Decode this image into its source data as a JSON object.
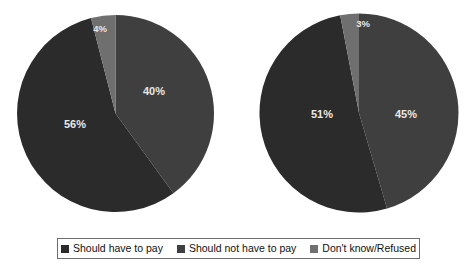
{
  "chart_data": [
    {
      "type": "pie",
      "title": "",
      "chart_index": 1,
      "categories": [
        "Should have to pay",
        "Should not have to pay",
        "Don't know/Refused"
      ],
      "values": [
        56,
        40,
        4
      ],
      "labels": [
        "56%",
        "40%",
        "4%"
      ],
      "colors": [
        "#2b2b2b",
        "#3f3f3f",
        "#6f6f6f"
      ],
      "legend_position": "bottom",
      "grid": false
    },
    {
      "type": "pie",
      "title": "",
      "chart_index": 2,
      "categories": [
        "Should have to pay",
        "Should not have to pay",
        "Don't know/Refused"
      ],
      "values": [
        51,
        45,
        3
      ],
      "labels": [
        "51%",
        "45%",
        "3%"
      ],
      "colors": [
        "#2b2b2b",
        "#3f3f3f",
        "#6f6f6f"
      ],
      "legend_position": "bottom",
      "grid": false
    }
  ],
  "charts": {
    "left": {
      "slice_should_pay": "56%",
      "slice_should_not_pay": "40%",
      "slice_dont_know": "4%"
    },
    "right": {
      "slice_should_pay": "51%",
      "slice_should_not_pay": "45%",
      "slice_dont_know": "3%"
    }
  },
  "legend": {
    "items": [
      {
        "label": "Should have to pay",
        "color": "#2b2b2b"
      },
      {
        "label": "Should not have to pay",
        "color": "#3f3f3f"
      },
      {
        "label": "Don't know/Refused",
        "color": "#6f6f6f"
      }
    ]
  }
}
